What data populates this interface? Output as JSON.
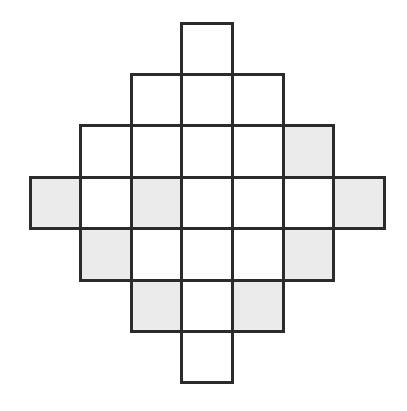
{
  "figure": {
    "type": "grid-diagram",
    "canvas": {
      "width": 407,
      "height": 411,
      "background": "#ffffff"
    },
    "grid": {
      "rows": 7,
      "cols": 7,
      "cell_width": 50.6,
      "cell_height": 51.4,
      "origin_x": 30,
      "origin_y": 23,
      "stroke_color": "#2b2b2b",
      "stroke_width": 3,
      "fill_white": "#ffffff",
      "fill_shaded": "#ebebeb"
    },
    "legend": {
      "white_label": "unshaded square",
      "shaded_label": "shaded square"
    },
    "counts": {
      "total_squares": 25,
      "shaded_squares": 8,
      "white_squares": 17
    },
    "cells": [
      {
        "row": 0,
        "col": 3,
        "shaded": false
      },
      {
        "row": 1,
        "col": 2,
        "shaded": false
      },
      {
        "row": 1,
        "col": 3,
        "shaded": false
      },
      {
        "row": 1,
        "col": 4,
        "shaded": false
      },
      {
        "row": 2,
        "col": 1,
        "shaded": false
      },
      {
        "row": 2,
        "col": 2,
        "shaded": false
      },
      {
        "row": 2,
        "col": 3,
        "shaded": false
      },
      {
        "row": 2,
        "col": 4,
        "shaded": false
      },
      {
        "row": 2,
        "col": 5,
        "shaded": true
      },
      {
        "row": 3,
        "col": 0,
        "shaded": true
      },
      {
        "row": 3,
        "col": 1,
        "shaded": false
      },
      {
        "row": 3,
        "col": 2,
        "shaded": true
      },
      {
        "row": 3,
        "col": 3,
        "shaded": false
      },
      {
        "row": 3,
        "col": 4,
        "shaded": false
      },
      {
        "row": 3,
        "col": 5,
        "shaded": false
      },
      {
        "row": 3,
        "col": 6,
        "shaded": true
      },
      {
        "row": 4,
        "col": 1,
        "shaded": true
      },
      {
        "row": 4,
        "col": 2,
        "shaded": false
      },
      {
        "row": 4,
        "col": 3,
        "shaded": false
      },
      {
        "row": 4,
        "col": 4,
        "shaded": false
      },
      {
        "row": 4,
        "col": 5,
        "shaded": true
      },
      {
        "row": 5,
        "col": 2,
        "shaded": true
      },
      {
        "row": 5,
        "col": 3,
        "shaded": false
      },
      {
        "row": 5,
        "col": 4,
        "shaded": true
      },
      {
        "row": 6,
        "col": 3,
        "shaded": false
      }
    ]
  }
}
